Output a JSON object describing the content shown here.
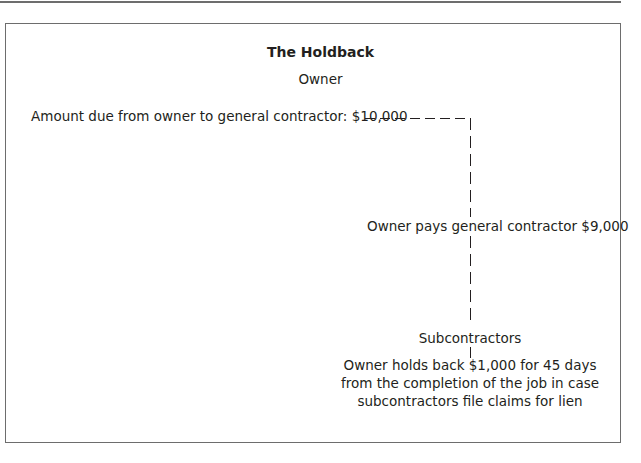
{
  "diagram": {
    "title": "The Holdback",
    "nodes": {
      "owner": "Owner",
      "amount_due": "Amount due from owner to general contractor: $10,000",
      "owner_pays": "Owner pays general contractor $9,000",
      "subcontractors": "Subcontractors",
      "holdback_note": "Owner holds back $1,000 for 45 days from the completion of the job in case subcontractors file claims for lien"
    },
    "connector_style": "dashed",
    "colors": {
      "text": "#231f20",
      "border": "#6d6d6d"
    }
  }
}
